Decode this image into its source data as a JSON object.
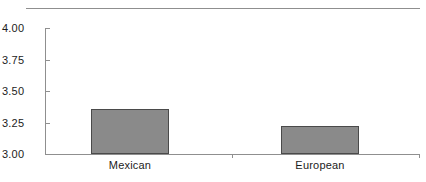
{
  "chart_data": {
    "type": "bar",
    "title": "",
    "subtitle": "",
    "xlabel": "",
    "ylabel": "",
    "categories": [
      "Mexican",
      "European"
    ],
    "values": [
      3.36,
      3.22
    ],
    "series": [
      {
        "name": "",
        "values": [
          3.36,
          3.22
        ]
      }
    ],
    "ylim": [
      3.0,
      4.0
    ],
    "ytick_labels": [
      "4.00",
      "3.75",
      "3.50",
      "3.25",
      "3.00"
    ],
    "ytick_values": [
      4.0,
      3.75,
      3.5,
      3.25,
      3.0
    ],
    "grid": false,
    "legend": null,
    "legend_position": "none",
    "annotations": [],
    "bar_color": "#8a8a8a",
    "bar_edge_color": "#4a4a4a",
    "axis_color": "#8f8f8f",
    "text_color": "#1c1c1c",
    "background": "#ffffff"
  },
  "figure": {
    "top_rule": "horizontal-rule"
  }
}
